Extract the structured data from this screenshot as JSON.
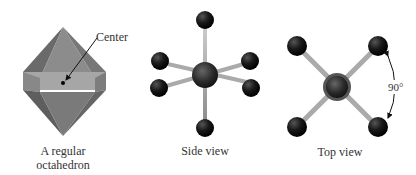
{
  "panels": [
    {
      "id": "octahedron",
      "caption_line1": "A regular",
      "caption_line2": "octahedron",
      "annotation": "Center"
    },
    {
      "id": "side-view",
      "caption": "Side view"
    },
    {
      "id": "top-view",
      "caption": "Top view",
      "angle_label": "90°"
    }
  ],
  "colors": {
    "solid_dark": "#6e6e6e",
    "solid_mid": "#8a8a8a",
    "solid_band": "#a9a9a9",
    "atom": "#111111",
    "bond": "#a8a8a8"
  }
}
